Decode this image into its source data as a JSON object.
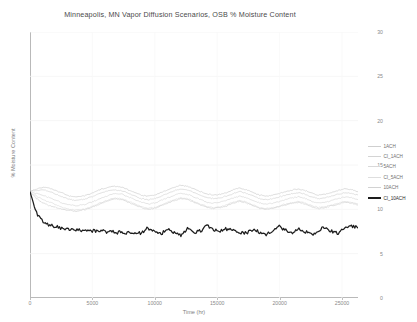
{
  "chart_data": {
    "type": "line",
    "title": "Minneapolis, MN Vapor Diffusion Scenarios, OSB % Moisture Content",
    "xlabel": "Time (hr)",
    "ylabel": "% Moisture Content",
    "xlim": [
      0,
      26280
    ],
    "ylim": [
      0,
      30
    ],
    "xticks": [
      0,
      5000,
      10000,
      15000,
      20000,
      25000
    ],
    "yticks": [
      0,
      5,
      10,
      15,
      20,
      25,
      30
    ],
    "grid": true,
    "legend_position": "right",
    "series": [
      {
        "name": "1ACH",
        "color": "#cfcfcf",
        "values": [
          12.0,
          12.3,
          12.5,
          12.4,
          12.1,
          11.8,
          11.5,
          11.4,
          11.5,
          11.7,
          12.0,
          12.3,
          12.5,
          12.6,
          12.5,
          12.2,
          11.9,
          11.6,
          11.5,
          11.6,
          11.9,
          12.2,
          12.5,
          12.7,
          12.6,
          12.3,
          12.0,
          11.7,
          11.6,
          11.7,
          11.9,
          12.2,
          12.4,
          12.2,
          11.9,
          11.6,
          11.5,
          11.6,
          11.8,
          12.0,
          12.2,
          12.3,
          12.1,
          11.8,
          11.6,
          11.7,
          11.9,
          12.1,
          12.3,
          12.2,
          12.0
        ]
      },
      {
        "name": "CI_1ACH",
        "color": "#d4d4d4",
        "values": [
          12.0,
          12.1,
          12.2,
          12.0,
          11.7,
          11.4,
          11.1,
          11.0,
          11.1,
          11.3,
          11.6,
          11.9,
          12.1,
          12.2,
          12.1,
          11.8,
          11.5,
          11.2,
          11.1,
          11.2,
          11.5,
          11.8,
          12.1,
          12.3,
          12.2,
          11.9,
          11.6,
          11.3,
          11.2,
          11.3,
          11.5,
          11.8,
          12.0,
          11.8,
          11.5,
          11.2,
          11.1,
          11.2,
          11.4,
          11.6,
          11.8,
          11.9,
          11.7,
          11.4,
          11.2,
          11.3,
          11.5,
          11.7,
          11.9,
          11.8,
          11.6
        ]
      },
      {
        "name": "5ACH",
        "color": "#d9d9d9",
        "values": [
          12.0,
          11.8,
          11.6,
          11.3,
          11.0,
          10.7,
          10.5,
          10.4,
          10.5,
          10.7,
          11.0,
          11.3,
          11.6,
          11.8,
          11.7,
          11.4,
          11.1,
          10.8,
          10.6,
          10.7,
          11.0,
          11.3,
          11.6,
          11.8,
          11.7,
          11.4,
          11.1,
          10.8,
          10.7,
          10.8,
          11.0,
          11.3,
          11.5,
          11.3,
          11.0,
          10.7,
          10.6,
          10.7,
          10.9,
          11.1,
          11.3,
          11.4,
          11.2,
          10.9,
          10.7,
          10.8,
          11.0,
          11.2,
          11.4,
          11.3,
          11.1
        ]
      },
      {
        "name": "CI_5ACH",
        "color": "#dedede",
        "values": [
          12.0,
          11.5,
          11.1,
          10.8,
          10.5,
          10.2,
          10.0,
          9.9,
          10.0,
          10.2,
          10.5,
          10.8,
          11.1,
          11.3,
          11.2,
          10.9,
          10.6,
          10.3,
          10.1,
          10.2,
          10.5,
          10.8,
          11.1,
          11.3,
          11.2,
          10.9,
          10.6,
          10.3,
          10.2,
          10.3,
          10.5,
          10.8,
          11.0,
          10.8,
          10.5,
          10.2,
          10.1,
          10.2,
          10.4,
          10.6,
          10.8,
          10.9,
          10.7,
          10.4,
          10.2,
          10.3,
          10.5,
          10.7,
          10.9,
          10.8,
          10.6
        ]
      },
      {
        "name": "10ACH",
        "color": "#d2d2d2",
        "values": [
          12.0,
          11.2,
          10.7,
          10.4,
          10.2,
          10.0,
          9.9,
          9.8,
          9.9,
          10.1,
          10.4,
          10.7,
          11.0,
          11.2,
          11.1,
          10.8,
          10.5,
          10.2,
          10.0,
          10.1,
          10.4,
          10.7,
          11.0,
          11.2,
          11.1,
          10.8,
          10.5,
          10.2,
          10.1,
          10.2,
          10.4,
          10.7,
          10.9,
          10.7,
          10.4,
          10.1,
          10.0,
          10.1,
          10.3,
          10.5,
          10.7,
          10.8,
          10.6,
          10.3,
          10.1,
          10.2,
          10.4,
          10.6,
          10.8,
          10.7,
          10.5
        ]
      },
      {
        "name": "CI_10ACH",
        "color": "#1d1d1d",
        "emphasis": true,
        "values": [
          12.0,
          9.6,
          8.6,
          8.2,
          8.0,
          7.9,
          7.8,
          7.7,
          7.65,
          7.6,
          7.55,
          7.5,
          7.5,
          7.45,
          7.4,
          7.35,
          7.3,
          7.3,
          7.9,
          7.5,
          7.2,
          7.8,
          7.3,
          7.1,
          7.9,
          7.4,
          7.6,
          8.2,
          7.7,
          7.5,
          7.8,
          7.5,
          7.3,
          7.4,
          7.6,
          7.4,
          7.2,
          7.5,
          8.1,
          7.6,
          7.3,
          7.8,
          7.4,
          7.2,
          7.6,
          8.0,
          7.5,
          7.3,
          7.8,
          8.1,
          7.9
        ]
      }
    ]
  },
  "legend": {
    "entries": [
      {
        "label": "1ACH"
      },
      {
        "label": "CI_1ACH"
      },
      {
        "label": "5ACH"
      },
      {
        "label": "CI_5ACH"
      },
      {
        "label": "10ACH"
      },
      {
        "label": "CI_10ACH"
      }
    ]
  },
  "axes": {
    "y_tick_labels": [
      "30",
      "25",
      "20",
      "15",
      "10",
      "5",
      "0"
    ],
    "x_tick_labels": [
      "0",
      "5000",
      "10000",
      "15000",
      "20000",
      "25000"
    ]
  }
}
